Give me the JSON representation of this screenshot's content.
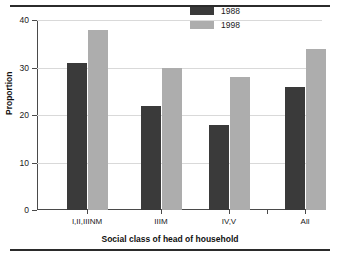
{
  "chart_data": {
    "type": "bar",
    "title": "",
    "subtitle": "",
    "xlabel": "Social class of head of household",
    "ylabel": "Proportion",
    "categories": [
      "I,II,IIINM",
      "IIIM",
      "IV,V",
      "All"
    ],
    "series": [
      {
        "name": "1988",
        "values": [
          31,
          22,
          18,
          26
        ],
        "color": "#3a3a3a"
      },
      {
        "name": "1998",
        "values": [
          38,
          30,
          28,
          34
        ],
        "color": "#adadad"
      }
    ],
    "ylim": [
      0,
      40
    ],
    "yticks": [
      0,
      10,
      20,
      30,
      40
    ],
    "ytick_labels": [
      "0",
      "10",
      "20",
      "30",
      "40"
    ],
    "grid": true,
    "grid_axis": "y",
    "legend_position": "top-right",
    "legend_entries": [
      "1988",
      "1998"
    ],
    "background_color": "#ffffff",
    "axis_color": "#4a4a4a",
    "gridline_color": "#d9d9d9",
    "rule_color": "#2b2b2b"
  }
}
